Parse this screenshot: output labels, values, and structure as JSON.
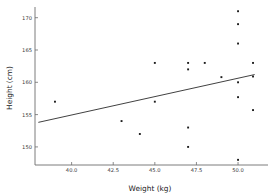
{
  "chart_data": {
    "type": "scatter",
    "title": "",
    "xlabel": "Weight (kg)",
    "ylabel": "Height (cm)",
    "xlim": [
      37.8,
      51.8
    ],
    "ylim": [
      147.2,
      171.5
    ],
    "xticks": [
      40.0,
      42.5,
      45.0,
      47.5,
      50.0
    ],
    "xticklabels": [
      "40.0",
      "42.5",
      "45.0",
      "47.5",
      "50.0"
    ],
    "yticks": [
      150,
      155,
      160,
      165,
      170
    ],
    "yticklabels": [
      "150",
      "155",
      "160",
      "165",
      "170"
    ],
    "grid": false,
    "legend": null,
    "marker": "square",
    "marker_color": "#1d1d1d",
    "points": [
      {
        "x": 39.0,
        "y": 157.0
      },
      {
        "x": 43.0,
        "y": 154.0
      },
      {
        "x": 44.1,
        "y": 152.0
      },
      {
        "x": 45.0,
        "y": 163.0
      },
      {
        "x": 45.0,
        "y": 157.0
      },
      {
        "x": 47.0,
        "y": 163.0
      },
      {
        "x": 47.0,
        "y": 162.0
      },
      {
        "x": 47.0,
        "y": 153.0
      },
      {
        "x": 47.0,
        "y": 150.0
      },
      {
        "x": 48.0,
        "y": 163.0
      },
      {
        "x": 49.0,
        "y": 160.8
      },
      {
        "x": 50.0,
        "y": 171.0
      },
      {
        "x": 50.0,
        "y": 169.0
      },
      {
        "x": 50.0,
        "y": 166.0
      },
      {
        "x": 50.0,
        "y": 160.0
      },
      {
        "x": 50.0,
        "y": 157.7
      },
      {
        "x": 50.0,
        "y": 148.0
      },
      {
        "x": 50.9,
        "y": 163.0
      },
      {
        "x": 50.9,
        "y": 160.9
      },
      {
        "x": 50.9,
        "y": 155.7
      }
    ],
    "trendline": {
      "type": "linear-fit",
      "x0": 38.0,
      "y0": 153.8,
      "x1": 51.0,
      "y1": 161.2,
      "color": "#2b2b2b"
    }
  }
}
